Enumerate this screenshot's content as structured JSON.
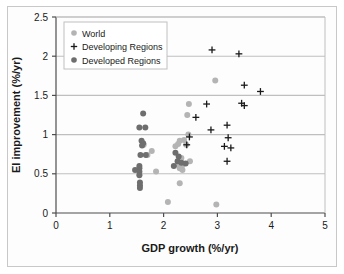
{
  "chart_data": {
    "type": "scatter",
    "title": "",
    "xlabel": "GDP growth (%/yr)",
    "ylabel": "EI improvement (%/yr)",
    "xlim": [
      0,
      5
    ],
    "ylim": [
      0,
      2.5
    ],
    "xticks": [
      "0",
      "1",
      "2",
      "3",
      "4",
      "5"
    ],
    "yticks": [
      "0",
      "0.5",
      "1",
      "1.5",
      "2",
      "2.5"
    ],
    "grid": "horizontal",
    "legend_position": "top-left",
    "series": [
      {
        "name": "World",
        "marker": "circle",
        "color": "#b4b4b4",
        "points": [
          [
            2.47,
            1.39
          ],
          [
            2.44,
            1.25
          ],
          [
            2.46,
            1.0
          ],
          [
            2.96,
            1.69
          ],
          [
            2.38,
            0.93
          ],
          [
            2.3,
            0.92
          ],
          [
            2.27,
            0.88
          ],
          [
            2.22,
            0.85
          ],
          [
            1.78,
            0.79
          ],
          [
            1.7,
            0.74
          ],
          [
            2.42,
            0.87
          ],
          [
            2.49,
            0.66
          ],
          [
            2.33,
            0.7
          ],
          [
            2.31,
            0.67
          ],
          [
            2.26,
            0.62
          ],
          [
            2.34,
            0.6
          ],
          [
            2.3,
            0.57
          ],
          [
            2.35,
            0.55
          ],
          [
            1.86,
            0.53
          ],
          [
            2.3,
            0.38
          ],
          [
            2.08,
            0.14
          ],
          [
            2.98,
            0.11
          ],
          [
            1.63,
            0.87
          ],
          [
            1.55,
            0.5
          ]
        ]
      },
      {
        "name": "Developing Regions",
        "marker": "plus",
        "color": "#1a1a1a",
        "points": [
          [
            2.9,
            2.08
          ],
          [
            3.4,
            2.03
          ],
          [
            3.5,
            1.63
          ],
          [
            3.8,
            1.55
          ],
          [
            3.45,
            1.4
          ],
          [
            3.5,
            1.37
          ],
          [
            2.8,
            1.39
          ],
          [
            2.6,
            1.22
          ],
          [
            3.18,
            1.12
          ],
          [
            2.88,
            1.06
          ],
          [
            2.48,
            0.97
          ],
          [
            3.2,
            0.96
          ],
          [
            3.13,
            0.85
          ],
          [
            3.25,
            0.83
          ],
          [
            2.43,
            0.87
          ],
          [
            3.18,
            0.66
          ]
        ]
      },
      {
        "name": "Developed Regions",
        "marker": "circle",
        "color": "#6e6e6e",
        "points": [
          [
            1.62,
            1.27
          ],
          [
            1.55,
            1.09
          ],
          [
            1.66,
            1.09
          ],
          [
            1.59,
            0.92
          ],
          [
            1.62,
            0.89
          ],
          [
            1.6,
            0.86
          ],
          [
            1.57,
            0.74
          ],
          [
            1.67,
            0.74
          ],
          [
            1.55,
            0.6
          ],
          [
            1.55,
            0.57
          ],
          [
            1.55,
            0.53
          ],
          [
            1.55,
            0.48
          ],
          [
            1.56,
            0.39
          ],
          [
            1.56,
            0.35
          ],
          [
            1.56,
            0.32
          ],
          [
            2.22,
            0.77
          ],
          [
            2.28,
            0.72
          ],
          [
            2.26,
            0.66
          ],
          [
            2.33,
            0.64
          ],
          [
            2.19,
            0.6
          ],
          [
            2.41,
            0.63
          ],
          [
            1.47,
            0.55
          ]
        ]
      }
    ]
  },
  "legend": {
    "items": [
      {
        "label": "World",
        "marker": "circle",
        "color": "#b4b4b4"
      },
      {
        "label": "Developing Regions",
        "marker": "plus",
        "color": "#1a1a1a"
      },
      {
        "label": "Developed Regions",
        "marker": "circle",
        "color": "#6e6e6e"
      }
    ]
  },
  "colors": {
    "world": "#b4b4b4",
    "developing": "#1a1a1a",
    "developed": "#6e6e6e",
    "axis": "#4d4d4d",
    "grid": "#bfbfbf",
    "frame": "#c8c8c8",
    "plot_background": "#fdfdfd"
  }
}
